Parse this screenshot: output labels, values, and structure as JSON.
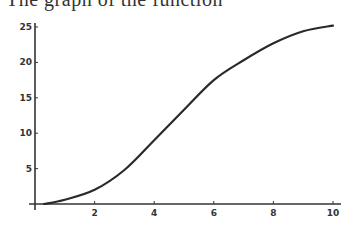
{
  "caption": "The graph of the function",
  "chart_data": {
    "type": "line",
    "title": "",
    "xlabel": "",
    "ylabel": "",
    "xlim": [
      0,
      10.25
    ],
    "ylim": [
      0,
      25.5
    ],
    "x_ticks": [
      2,
      4,
      6,
      8,
      10
    ],
    "y_ticks": [
      5,
      10,
      15,
      20,
      25
    ],
    "grid": false,
    "legend": null,
    "series": [
      {
        "name": "curve",
        "x": [
          0.3,
          1,
          2,
          3,
          4,
          5,
          6,
          7,
          8,
          9,
          10
        ],
        "y": [
          0.0,
          0.6,
          2.0,
          4.8,
          9.0,
          13.3,
          17.5,
          20.3,
          22.7,
          24.4,
          25.2
        ]
      }
    ]
  },
  "axes": {
    "x_tick_labels": [
      "2",
      "4",
      "6",
      "8",
      "10"
    ],
    "y_tick_labels": [
      "5",
      "10",
      "15",
      "20",
      "25"
    ]
  }
}
